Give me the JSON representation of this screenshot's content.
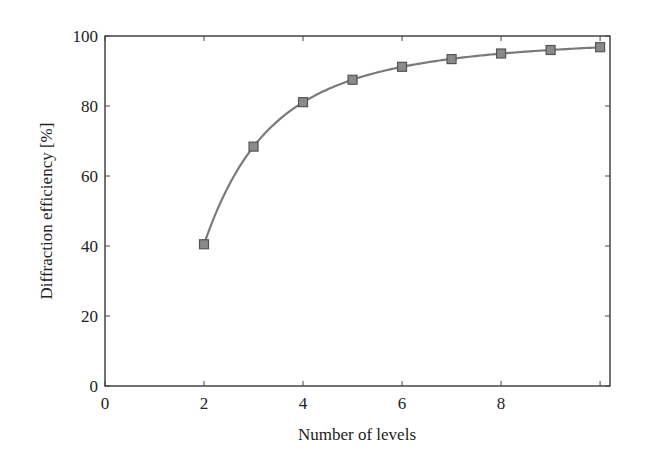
{
  "chart_data": {
    "type": "line",
    "title": "",
    "xlabel": "Number of levels",
    "ylabel": "Diffraction efficiency [%]",
    "xlim": [
      0,
      10.2
    ],
    "ylim": [
      0,
      100
    ],
    "x_ticks": [
      0,
      2,
      4,
      6,
      8,
      10
    ],
    "x_tick_labels": [
      "0",
      "2",
      "4",
      "6",
      "8",
      ""
    ],
    "y_ticks": [
      0,
      20,
      40,
      60,
      80,
      100
    ],
    "y_tick_labels": [
      "0",
      "20",
      "40",
      "60",
      "80",
      "100"
    ],
    "grid": false,
    "legend": null,
    "series": [
      {
        "name": "Diffraction efficiency",
        "marker": "square",
        "x": [
          2,
          3,
          4,
          5,
          6,
          7,
          8,
          9,
          10
        ],
        "y": [
          40.5,
          68.4,
          81.1,
          87.5,
          91.2,
          93.4,
          95.0,
          96.0,
          96.8
        ]
      }
    ],
    "colors": {
      "line": "#7a7a7a",
      "marker_fill": "#8a8a8a",
      "marker_edge": "#555555",
      "axis": "#444444"
    }
  }
}
